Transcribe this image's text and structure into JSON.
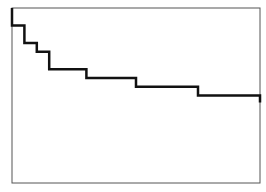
{
  "chart_data": {
    "type": "line",
    "subtype": "step",
    "title": "",
    "xlabel": "",
    "ylabel": "",
    "grid": false,
    "legend": null,
    "xlim": [
      0,
      1
    ],
    "ylim": [
      0,
      1
    ],
    "series": [
      {
        "name": "step",
        "color": "#111111",
        "x": [
          0.0,
          0.0,
          0.05,
          0.1,
          0.15,
          0.3,
          0.5,
          0.75,
          1.0,
          1.0
        ],
        "y": [
          1.0,
          0.9,
          0.8,
          0.75,
          0.65,
          0.6,
          0.55,
          0.5,
          0.5,
          0.46
        ]
      }
    ]
  },
  "frame": {
    "left": 12,
    "top": 8,
    "right": 260,
    "bottom": 183,
    "border_color": "#555555",
    "line_color": "#111111"
  }
}
